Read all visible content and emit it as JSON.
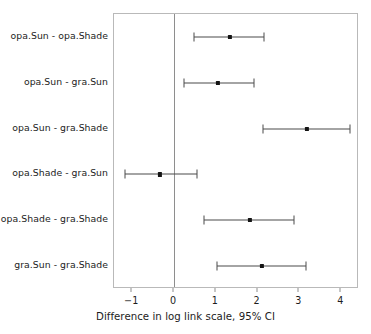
{
  "chart_data": {
    "type": "scatter",
    "title": "",
    "subtitle": "",
    "xlabel": "Difference in log link scale, 95% CI",
    "ylabel": "",
    "xlim": [
      -1.45,
      4.45
    ],
    "xticks": [
      -1,
      0,
      1,
      2,
      3,
      4
    ],
    "xticklabels": [
      "−1",
      "0",
      "1",
      "2",
      "3",
      "4"
    ],
    "grid": false,
    "legend": null,
    "reference_line": {
      "x": 0,
      "color": "#8e8e8e"
    },
    "categories": [
      "opa.Sun - opa.Shade",
      "opa.Sun - gra.Sun",
      "opa.Sun - gra.Shade",
      "opa.Shade - gra.Sun",
      "opa.Shade - gra.Shade",
      "gra.Sun - gra.Shade"
    ],
    "estimates": [
      1.34,
      1.05,
      3.18,
      -0.33,
      1.82,
      2.11
    ],
    "ci_lower": [
      0.48,
      0.24,
      2.13,
      -1.17,
      0.72,
      1.03
    ],
    "ci_upper": [
      2.15,
      1.91,
      4.21,
      0.55,
      2.87,
      3.16
    ],
    "points": [
      {
        "label": "opa.Sun - opa.Shade",
        "estimate": 1.34,
        "lower": 0.48,
        "upper": 2.15
      },
      {
        "label": "opa.Sun - gra.Sun",
        "estimate": 1.05,
        "lower": 0.24,
        "upper": 1.91
      },
      {
        "label": "opa.Sun - gra.Shade",
        "estimate": 3.18,
        "lower": 2.13,
        "upper": 4.21
      },
      {
        "label": "opa.Shade - gra.Sun",
        "estimate": -0.33,
        "lower": -1.17,
        "upper": 0.55
      },
      {
        "label": "opa.Shade - gra.Shade",
        "estimate": 1.82,
        "lower": 0.72,
        "upper": 2.87
      },
      {
        "label": "gra.Sun - gra.Shade",
        "estimate": 2.11,
        "lower": 1.03,
        "upper": 3.16
      }
    ],
    "colors": {
      "point": "#141414",
      "interval": "#4a4a4a",
      "panel_border": "#b9b9b9",
      "axis": "#8e8e8e",
      "text": "#1c1c1c",
      "background": "#ffffff"
    }
  },
  "layout": {
    "panel": {
      "left": 113,
      "top": 13,
      "right": 358,
      "bottom": 288
    },
    "x_axis": {
      "pixel_at_zero": 173.0,
      "pixels_per_unit": 41.8
    }
  }
}
